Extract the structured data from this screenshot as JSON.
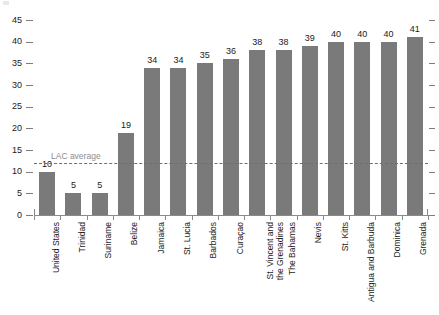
{
  "chart_data": {
    "type": "bar",
    "title": "",
    "subtitle": "",
    "xlabel": "",
    "ylabel": "",
    "ylim": [
      0,
      45
    ],
    "yticks": [
      0,
      5,
      10,
      15,
      20,
      25,
      30,
      35,
      40,
      45
    ],
    "ytick_labels": [
      "0",
      "5",
      "10",
      "15",
      "20",
      "25",
      "30",
      "35",
      "40",
      "45"
    ],
    "grid": false,
    "legend": null,
    "bar_color": "#7a7a7a",
    "categories": [
      "United States",
      "Trinidad",
      "Suriname",
      "Belize",
      "Jamaica",
      "St. Lucia",
      "Barbados",
      "Curaçao",
      "St. Vincent and\nthe Grenadines",
      "The Bahamas",
      "Nevis",
      "St. Kitts",
      "Antigua and Barbuda",
      "Dominica",
      "Grenada"
    ],
    "values": [
      10,
      5,
      5,
      19,
      34,
      34,
      35,
      36,
      38,
      38,
      39,
      40,
      40,
      40,
      41
    ],
    "value_labels": [
      "10",
      "5",
      "5",
      "19",
      "34",
      "34",
      "35",
      "36",
      "38",
      "38",
      "39",
      "40",
      "40",
      "40",
      "41"
    ],
    "annotations": [
      {
        "name": "lac-average",
        "label": "LAC average",
        "value": 12,
        "style": "dashed-horizontal-line",
        "color": "#6f6f6f",
        "label_color": "#8d8d8d"
      }
    ]
  }
}
